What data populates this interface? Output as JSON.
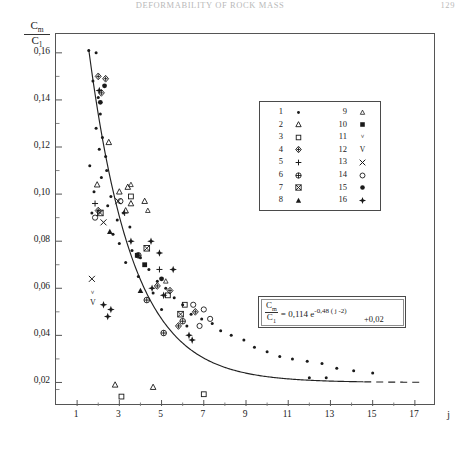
{
  "runhead": {
    "title": "DEFORMABILITY OF ROCK MASS",
    "page": "129"
  },
  "chart_data": {
    "type": "scatter",
    "title": "",
    "xlabel": "j",
    "ylabel": "Cm / C1",
    "ylabel_numerator": "C",
    "ylabel_numerator_sub": "m",
    "ylabel_denominator": "C",
    "ylabel_denominator_sub": "1",
    "xlim": [
      0,
      18
    ],
    "ylim": [
      0.01,
      0.168
    ],
    "xticks": [
      1,
      3,
      5,
      7,
      9,
      11,
      13,
      15,
      17
    ],
    "xticklabels": [
      "1",
      "3",
      "5",
      "7",
      "9",
      "11",
      "13",
      "15",
      "17"
    ],
    "xminorticks": [
      2,
      4,
      6,
      8,
      10,
      12,
      14,
      16
    ],
    "yticks": [
      0.16,
      0.14,
      0.12,
      0.1,
      0.08,
      0.06,
      0.04,
      0.02
    ],
    "yticklabels": [
      "0,16",
      "0,14",
      "0,12",
      "0,10",
      "0,08",
      "0,06",
      "0,04",
      "0,02"
    ],
    "yminorticks": [
      0.15,
      0.13,
      0.11,
      0.09,
      0.07,
      0.05,
      0.03,
      0.017
    ],
    "grid": false,
    "legend_position": "upper-right",
    "curve": {
      "label": "fitted exponential",
      "formula_a": 0.114,
      "formula_b": 0.48,
      "formula_j0": 2,
      "formula_c": 0.02,
      "solid_x_range": [
        1.55,
        14.6
      ],
      "dashed_x_range": [
        14.6,
        17.3
      ]
    },
    "equation": {
      "lhs_num": "C",
      "lhs_num_sub": "m",
      "lhs_den": "C",
      "lhs_den_sub": "1",
      "rhs_coefficient": "= 0,114 e",
      "exponent": "-0,48 ( j -2)",
      "constant": "+0,02"
    },
    "series": [
      {
        "name": "1",
        "symbol": "dot-small",
        "values": [
          [
            1.55,
            0.161
          ],
          [
            1.9,
            0.16
          ],
          [
            1.75,
            0.148
          ],
          [
            2.0,
            0.141
          ],
          [
            2.1,
            0.134
          ],
          [
            1.9,
            0.128
          ],
          [
            2.2,
            0.124
          ],
          [
            2.05,
            0.119
          ],
          [
            2.35,
            0.116
          ],
          [
            1.6,
            0.112
          ],
          [
            2.4,
            0.11
          ],
          [
            2.15,
            0.107
          ],
          [
            1.8,
            0.101
          ],
          [
            2.6,
            0.099
          ],
          [
            2.45,
            0.095
          ],
          [
            1.7,
            0.092
          ],
          [
            2.9,
            0.089
          ],
          [
            3.2,
            0.092
          ],
          [
            3.5,
            0.086
          ],
          [
            2.7,
            0.083
          ],
          [
            3.0,
            0.079
          ],
          [
            3.6,
            0.076
          ],
          [
            4.0,
            0.073
          ],
          [
            3.3,
            0.071
          ],
          [
            4.4,
            0.068
          ],
          [
            3.9,
            0.065
          ],
          [
            4.8,
            0.063
          ],
          [
            5.2,
            0.06
          ],
          [
            4.6,
            0.058
          ],
          [
            5.6,
            0.056
          ],
          [
            6.0,
            0.053
          ],
          [
            5.0,
            0.051
          ],
          [
            6.4,
            0.049
          ],
          [
            6.9,
            0.047
          ],
          [
            7.4,
            0.045
          ],
          [
            6.2,
            0.044
          ],
          [
            7.8,
            0.042
          ],
          [
            8.3,
            0.04
          ],
          [
            8.9,
            0.038
          ],
          [
            9.4,
            0.035
          ],
          [
            10.0,
            0.033
          ],
          [
            10.6,
            0.031
          ],
          [
            11.2,
            0.03
          ],
          [
            11.9,
            0.029
          ],
          [
            12.6,
            0.028
          ],
          [
            13.3,
            0.026
          ],
          [
            14.1,
            0.025
          ],
          [
            15.0,
            0.024
          ],
          [
            12.0,
            0.022
          ],
          [
            12.8,
            0.022
          ]
        ]
      },
      {
        "name": "2",
        "symbol": "triangle-up-open",
        "values": [
          [
            2.5,
            0.122
          ],
          [
            1.95,
            0.104
          ],
          [
            3.0,
            0.101
          ],
          [
            3.4,
            0.103
          ],
          [
            3.55,
            0.096
          ],
          [
            3.3,
            0.093
          ],
          [
            4.2,
            0.097
          ],
          [
            4.6,
            0.018
          ],
          [
            2.8,
            0.019
          ]
        ]
      },
      {
        "name": "3",
        "symbol": "square-open",
        "values": [
          [
            3.55,
            0.099
          ],
          [
            5.3,
            0.057
          ],
          [
            7.0,
            0.015
          ],
          [
            3.1,
            0.014
          ],
          [
            6.1,
            0.053
          ]
        ]
      },
      {
        "name": "4",
        "symbol": "diamond-cross",
        "values": [
          [
            2.0,
            0.15
          ],
          [
            2.35,
            0.149
          ],
          [
            2.15,
            0.143
          ],
          [
            2.0,
            0.093
          ],
          [
            4.8,
            0.061
          ],
          [
            5.4,
            0.059
          ],
          [
            6.6,
            0.05
          ],
          [
            5.8,
            0.044
          ]
        ]
      },
      {
        "name": "5",
        "symbol": "plus",
        "values": [
          [
            1.85,
            0.096
          ],
          [
            3.25,
            0.092
          ],
          [
            4.9,
            0.068
          ]
        ]
      },
      {
        "name": "6",
        "symbol": "circle-cross",
        "values": [
          [
            3.9,
            0.074
          ],
          [
            4.3,
            0.055
          ],
          [
            6.0,
            0.046
          ],
          [
            5.1,
            0.041
          ]
        ]
      },
      {
        "name": "7",
        "symbol": "square-cross",
        "values": [
          [
            2.1,
            0.092
          ],
          [
            4.3,
            0.077
          ],
          [
            5.9,
            0.049
          ]
        ]
      },
      {
        "name": "8",
        "symbol": "triangle-up-solid",
        "values": [
          [
            2.55,
            0.084
          ],
          [
            4.0,
            0.059
          ]
        ]
      },
      {
        "name": "9",
        "symbol": "triangle-up-tiny",
        "values": [
          [
            3.55,
            0.104
          ],
          [
            4.35,
            0.093
          ],
          [
            5.2,
            0.063
          ]
        ]
      },
      {
        "name": "10",
        "symbol": "square-solid",
        "values": [
          [
            3.85,
            0.074
          ],
          [
            4.2,
            0.07
          ]
        ]
      },
      {
        "name": "11",
        "symbol": "nu",
        "values": [
          [
            1.75,
            0.058
          ]
        ]
      },
      {
        "name": "12",
        "symbol": "vee",
        "values": [
          [
            1.75,
            0.054
          ]
        ]
      },
      {
        "name": "13",
        "symbol": "x-mark",
        "values": [
          [
            1.7,
            0.064
          ],
          [
            2.95,
            0.097
          ],
          [
            2.25,
            0.088
          ]
        ]
      },
      {
        "name": "14",
        "symbol": "circle-open",
        "values": [
          [
            1.85,
            0.09
          ],
          [
            3.05,
            0.097
          ],
          [
            6.5,
            0.053
          ],
          [
            7.0,
            0.051
          ],
          [
            7.3,
            0.047
          ],
          [
            6.8,
            0.044
          ]
        ]
      },
      {
        "name": "15",
        "symbol": "circle-solid",
        "values": [
          [
            2.3,
            0.146
          ],
          [
            2.1,
            0.139
          ],
          [
            5.0,
            0.064
          ]
        ]
      },
      {
        "name": "16",
        "symbol": "star-solid",
        "values": [
          [
            2.05,
            0.144
          ],
          [
            3.55,
            0.08
          ],
          [
            4.5,
            0.08
          ],
          [
            2.25,
            0.053
          ],
          [
            2.6,
            0.051
          ],
          [
            4.9,
            0.075
          ],
          [
            5.55,
            0.068
          ],
          [
            4.55,
            0.06
          ],
          [
            5.1,
            0.057
          ],
          [
            6.3,
            0.04
          ],
          [
            6.45,
            0.038
          ],
          [
            2.45,
            0.048
          ]
        ]
      }
    ],
    "legend_rows": [
      {
        "left_num": "1",
        "left_symbol": "dot-small",
        "right_num": "9",
        "right_symbol": "triangle-up-tiny"
      },
      {
        "left_num": "2",
        "left_symbol": "triangle-up-open",
        "right_num": "10",
        "right_symbol": "square-solid"
      },
      {
        "left_num": "3",
        "left_symbol": "square-open",
        "right_num": "11",
        "right_symbol": "nu"
      },
      {
        "left_num": "4",
        "left_symbol": "diamond-cross",
        "right_num": "12",
        "right_symbol": "vee"
      },
      {
        "left_num": "5",
        "left_symbol": "plus",
        "right_num": "13",
        "right_symbol": "x-mark"
      },
      {
        "left_num": "6",
        "left_symbol": "circle-cross",
        "right_num": "14",
        "right_symbol": "circle-open"
      },
      {
        "left_num": "7",
        "left_symbol": "square-cross",
        "right_num": "15",
        "right_symbol": "circle-solid"
      },
      {
        "left_num": "8",
        "left_symbol": "triangle-up-solid",
        "right_num": "16",
        "right_symbol": "star-solid"
      }
    ]
  }
}
